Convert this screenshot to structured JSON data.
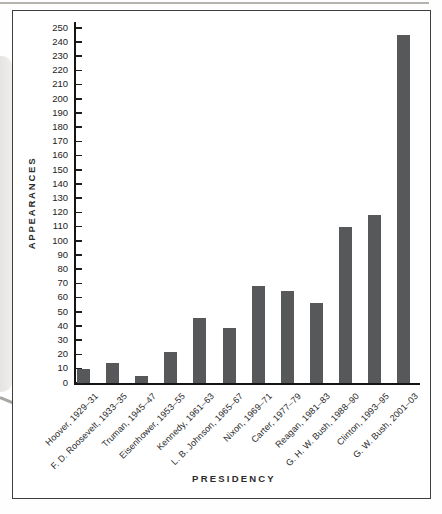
{
  "chart_data": {
    "type": "bar",
    "title": "",
    "xlabel": "PRESIDENCY",
    "ylabel": "APPEARANCES",
    "categories": [
      "Hoover, 1929–31",
      "F. D. Roosevelt, 1933–35",
      "Truman, 1945–47",
      "Eisenhower, 1953–55",
      "Kennedy, 1961–63",
      "L. B. Johnson, 1965–67",
      "Nixon, 1969–71",
      "Carter, 1977–79",
      "Reagan, 1981–83",
      "G. H. W. Bush, 1988–90",
      "Clinton, 1993–95",
      "G. W. Bush, 2001–03"
    ],
    "values": [
      10,
      14,
      5,
      22,
      46,
      39,
      68,
      65,
      56,
      110,
      118,
      245
    ],
    "ylim": [
      0,
      250
    ],
    "ytick_step": 10,
    "yticks": [
      0,
      10,
      20,
      30,
      40,
      50,
      60,
      70,
      80,
      90,
      100,
      110,
      120,
      130,
      140,
      150,
      160,
      170,
      180,
      190,
      200,
      210,
      220,
      230,
      240,
      250
    ],
    "grid": false,
    "legend": null,
    "bar_color": "#57585a",
    "axis_color": "#141414",
    "text_color": "#2b2b2b",
    "box_border_color": "#3e3e3e"
  }
}
